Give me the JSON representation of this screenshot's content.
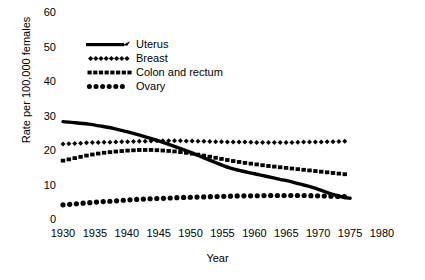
{
  "chart_data": {
    "type": "line",
    "title": "",
    "xlabel": "Year",
    "ylabel": "Rate per 100,000 females",
    "xlim": [
      1930,
      1980
    ],
    "ylim": [
      0,
      60
    ],
    "xticks": [
      "1930",
      "1935",
      "1940",
      "1945",
      "1950",
      "1955",
      "1960",
      "1965",
      "1970",
      "1975",
      "1980"
    ],
    "yticks": [
      "0",
      "10",
      "20",
      "30",
      "40",
      "50",
      "60"
    ],
    "grid": false,
    "legend_position": "upper-left-inside",
    "x": [
      1930,
      1932,
      1934,
      1936,
      1938,
      1940,
      1942,
      1944,
      1946,
      1948,
      1950,
      1952,
      1954,
      1956,
      1958,
      1960,
      1962,
      1964,
      1966,
      1968,
      1970,
      1972,
      1974,
      1975
    ],
    "series": [
      {
        "name": "Uterus",
        "style": "solid-line",
        "values": [
          28.5,
          28.2,
          27.8,
          27.2,
          26.5,
          25.6,
          24.6,
          23.5,
          22.3,
          21.0,
          19.6,
          18.1,
          16.6,
          15.2,
          14.2,
          13.4,
          12.6,
          11.8,
          11.0,
          10.0,
          8.9,
          7.6,
          6.6,
          6.3
        ]
      },
      {
        "name": "Breast",
        "style": "diamond-markers",
        "values": [
          22.0,
          22.2,
          22.4,
          22.5,
          22.6,
          22.7,
          22.8,
          22.9,
          23.0,
          23.0,
          22.9,
          22.8,
          22.7,
          22.6,
          22.6,
          22.5,
          22.5,
          22.5,
          22.5,
          22.6,
          22.6,
          22.7,
          22.8,
          22.8
        ]
      },
      {
        "name": "Colon and rectum",
        "style": "dash-markers",
        "values": [
          17.2,
          18.0,
          18.8,
          19.4,
          19.8,
          20.1,
          20.3,
          20.3,
          20.1,
          19.8,
          19.3,
          18.7,
          18.0,
          17.3,
          16.7,
          16.2,
          15.7,
          15.3,
          14.9,
          14.5,
          14.1,
          13.7,
          13.3,
          13.1
        ]
      },
      {
        "name": "Ovary",
        "style": "circle-markers",
        "values": [
          4.4,
          4.7,
          5.0,
          5.3,
          5.5,
          5.8,
          6.0,
          6.2,
          6.3,
          6.5,
          6.6,
          6.7,
          6.8,
          6.9,
          7.0,
          7.0,
          7.1,
          7.1,
          7.1,
          7.1,
          7.0,
          6.9,
          6.8,
          6.7
        ]
      }
    ]
  },
  "legend": {
    "items": [
      {
        "label": "Uterus",
        "key": "solid-line-with-arrow"
      },
      {
        "label": "Breast",
        "key": "diamond-row"
      },
      {
        "label": "Colon and rectum",
        "key": "dash-row"
      },
      {
        "label": "Ovary",
        "key": "circle-row"
      }
    ]
  },
  "axis_titles": {
    "x": "Year",
    "y": "Rate per 100,000 females"
  },
  "colors": {
    "ink": "#000000",
    "background": "#ffffff"
  }
}
